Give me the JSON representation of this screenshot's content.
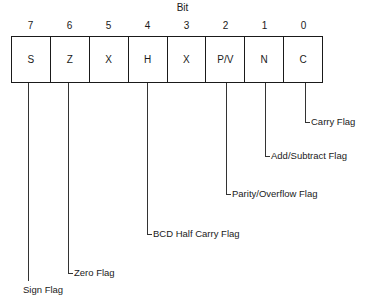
{
  "title": "Bit",
  "bits": [
    {
      "index": "7",
      "symbol": "S",
      "label": "Sign Flag"
    },
    {
      "index": "6",
      "symbol": "Z",
      "label": "Zero Flag"
    },
    {
      "index": "5",
      "symbol": "X",
      "label": ""
    },
    {
      "index": "4",
      "symbol": "H",
      "label": "BCD Half Carry Flag"
    },
    {
      "index": "3",
      "symbol": "X",
      "label": ""
    },
    {
      "index": "2",
      "symbol": "P/V",
      "label": "Parity/Overflow Flag"
    },
    {
      "index": "1",
      "symbol": "N",
      "label": "Add/Subtract Flag"
    },
    {
      "index": "0",
      "symbol": "C",
      "label": "Carry Flag"
    }
  ]
}
